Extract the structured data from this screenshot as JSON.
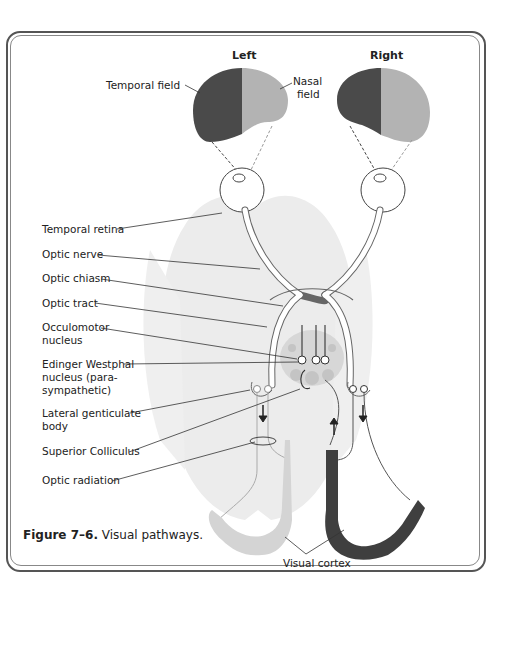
{
  "top_text": "a. The major site of ... (partially cropped)",
  "diagram": {
    "headers": {
      "left": "Left",
      "right": "Right"
    },
    "labels": {
      "temporal_field": "Temporal field",
      "nasal_field_line1": "Nasal",
      "nasal_field_line2": "field",
      "temporal_retina": "Temporal retina",
      "optic_nerve": "Optic nerve",
      "optic_chiasm": "Optic chiasm",
      "optic_tract": "Optic tract",
      "occulomotor_line1": "Occulomotor",
      "occulomotor_line2": "nucleus",
      "edinger_line1": "Edinger Westphal",
      "edinger_line2": "nucleus (para-",
      "edinger_line3": "sympathetic)",
      "lgb_line1": "Lateral genticulate",
      "lgb_line2": "body",
      "superior_colliculus": "Superior Colliculus",
      "optic_radiation": "Optic radiation",
      "visual_cortex": "Visual cortex"
    },
    "colors": {
      "dark_field": "#4a4a4a",
      "light_field": "#b3b3b3",
      "brain": "#ebebeb",
      "light_cortex": "#d4d4d4",
      "dark_cortex": "#3f3f3f"
    }
  },
  "caption": {
    "bold": "Figure 7–6.",
    "text": " Visual pathways."
  }
}
